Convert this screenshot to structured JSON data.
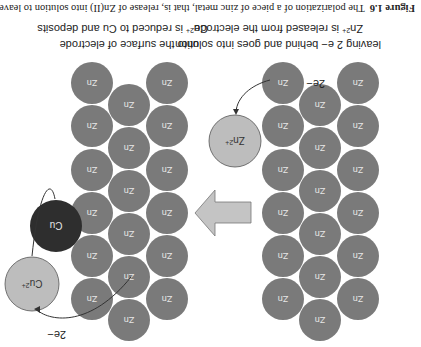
{
  "figure": {
    "caption_number": "Figure 1.6",
    "caption_text": "The polarization of a piece of zinc metal, that is, release of Zn(II) into solution to leave",
    "orientation": "rotated 180 degrees"
  },
  "labels": {
    "zn_release_line1": "Zn2+ is released from the electrode",
    "zn_release_line2": "leaving 2 e− behind and goes into solution",
    "cu_reduce_line1": "Cu2+ is reduced to Cu and deposits",
    "cu_reduce_line2": "onto the surface of electrode"
  },
  "atoms": {
    "zn_label": "Zn",
    "zn_ion": "Zn",
    "zn_ion_charge": "2+",
    "cu_label": "Cu",
    "cu_ion": "Cu",
    "cu_ion_charge": "2+",
    "electrons_left": "2e−",
    "electrons_right": "2e−"
  },
  "colors": {
    "zn_atom": "#7a7a7a",
    "cu_atom": "#2e2e2e",
    "ion": "#bdbdbd",
    "arrow_fill": "#c4c4c4"
  }
}
